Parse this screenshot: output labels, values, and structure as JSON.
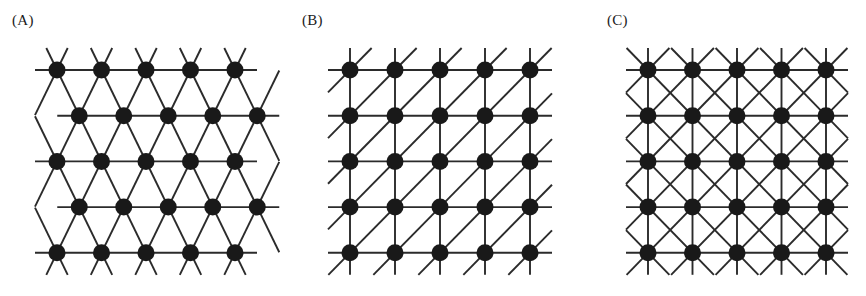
{
  "figure": {
    "background_color": "#ffffff",
    "line_color": "#2b2b2b",
    "node_color": "#191919",
    "width": 866,
    "height": 296
  },
  "panels": [
    {
      "id": "panel-a",
      "label": "(A)",
      "label_x": 12,
      "label_y": 12,
      "lattice_type": "triangular",
      "description": "Triangular lattice: 5 rows of 5 sites, alternate rows offset by half a spacing, six bonds per site (horizontal plus two diagonal directions).",
      "rows": 5,
      "cols": 5,
      "spacing_x": 44.5,
      "spacing_y": 45.7,
      "row_offset_x": 22.25,
      "origin_x": 57,
      "origin_y": 70,
      "node_radius": 8.5,
      "stub_length": 22,
      "coordination_number": 6
    },
    {
      "id": "panel-b",
      "label": "(B)",
      "label_x": 302,
      "label_y": 12,
      "lattice_type": "square-with-one-diagonal",
      "description": "Square lattice: 5 by 5 sites with horizontal and vertical bonds plus a single set of diagonals running from lower-left to upper-right.",
      "rows": 5,
      "cols": 5,
      "spacing_x": 45.0,
      "spacing_y": 45.7,
      "origin_x": 350,
      "origin_y": 70,
      "node_radius": 8.5,
      "stub_length": 22,
      "coordination_number": 6
    },
    {
      "id": "panel-c",
      "label": "(C)",
      "label_x": 607,
      "label_y": 12,
      "lattice_type": "square-with-both-diagonals",
      "description": "Square lattice: 5 by 5 sites with horizontal and vertical bonds plus both sets of diagonals, forming crossed X / diamond motifs.",
      "rows": 5,
      "cols": 5,
      "spacing_x": 44.5,
      "spacing_y": 45.7,
      "origin_x": 648,
      "origin_y": 70,
      "node_radius": 8.5,
      "stub_length": 22,
      "coordination_number": 8
    }
  ]
}
